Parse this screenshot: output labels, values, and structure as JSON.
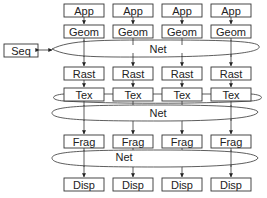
{
  "diagram": {
    "type": "pipeline-architecture",
    "colors": {
      "stroke": "#333333",
      "fill": "#ffffff",
      "text": "#222222"
    },
    "columns": 4,
    "stages": {
      "app": {
        "label": "App"
      },
      "geom": {
        "label": "Geom"
      },
      "rast": {
        "label": "Rast"
      },
      "tex": {
        "label": "Tex"
      },
      "frag": {
        "label": "Frag"
      },
      "disp": {
        "label": "Disp"
      }
    },
    "seq": {
      "label": "Seq"
    },
    "nets": [
      {
        "label": "Net",
        "position": "between Geom and Rast"
      },
      {
        "label": "Net",
        "position": "between Tex and Frag"
      },
      {
        "label": "Net",
        "position": "between Frag and Disp"
      }
    ],
    "rows": [
      {
        "labels": [
          "App",
          "App",
          "App",
          "App"
        ]
      },
      {
        "labels": [
          "Geom",
          "Geom",
          "Geom",
          "Geom"
        ]
      },
      {
        "labels": [
          "Rast",
          "Rast",
          "Rast",
          "Rast"
        ]
      },
      {
        "labels": [
          "Tex",
          "Tex",
          "Tex",
          "Tex"
        ]
      },
      {
        "labels": [
          "Frag",
          "Frag",
          "Frag",
          "Frag"
        ]
      },
      {
        "labels": [
          "Disp",
          "Disp",
          "Disp",
          "Disp"
        ]
      }
    ]
  }
}
